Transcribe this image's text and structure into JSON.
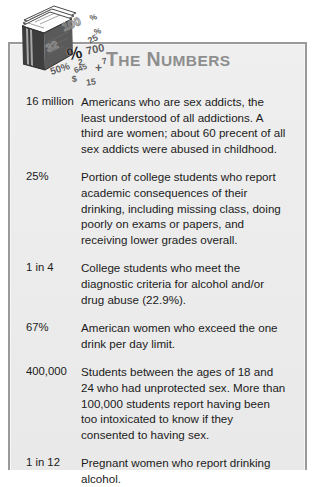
{
  "panel": {
    "title_first_letter": "T",
    "title_rest_word1": "HE",
    "title_second_letter": "N",
    "title_rest_word2": "UMBERS",
    "title_full": "THE NUMBERS",
    "icon_name": "stack-of-papers-icon",
    "background_color": "#ececec",
    "border_color": "#9a9a9a",
    "title_color": "#8e8e8e",
    "text_color": "#1b1b1b"
  },
  "numerals": [
    {
      "text": "100",
      "x": 52,
      "y": 17,
      "size": 11.5,
      "rot": -22,
      "style": "outline"
    },
    {
      "text": "%",
      "x": 80,
      "y": 12,
      "size": 8,
      "rot": -18,
      "style": "solid"
    },
    {
      "text": "%",
      "x": 84,
      "y": 26,
      "size": 8,
      "rot": -15,
      "style": "solid"
    },
    {
      "text": "25",
      "x": 78,
      "y": 33,
      "size": 9,
      "rot": -28,
      "style": "solid"
    },
    {
      "text": "32",
      "x": 36,
      "y": 39,
      "size": 11,
      "rot": -25,
      "style": "outline"
    },
    {
      "text": "%",
      "x": 57,
      "y": 43,
      "size": 17,
      "rot": -12,
      "style": "bold"
    },
    {
      "text": "700",
      "x": 76,
      "y": 42,
      "size": 11,
      "rot": -12,
      "style": "solid"
    },
    {
      "text": "2",
      "x": 68,
      "y": 56,
      "size": 8.5,
      "rot": -8,
      "style": "solid"
    },
    {
      "text": "7",
      "x": 92,
      "y": 55,
      "size": 8.5,
      "rot": -10,
      "style": "solid"
    },
    {
      "text": "50%",
      "x": 40,
      "y": 62,
      "size": 10,
      "rot": -18,
      "style": "solid"
    },
    {
      "text": "645",
      "x": 64,
      "y": 63,
      "size": 8,
      "rot": -22,
      "style": "solid"
    },
    {
      "text": "+",
      "x": 85,
      "y": 60,
      "size": 12,
      "rot": 0,
      "style": "solid"
    },
    {
      "text": "$",
      "x": 62,
      "y": 73,
      "size": 9,
      "rot": -8,
      "style": "solid"
    },
    {
      "text": "15",
      "x": 76,
      "y": 76,
      "size": 9,
      "rot": -8,
      "style": "solid"
    }
  ],
  "rows": [
    {
      "value": "16 million",
      "description": "Americans who are sex addicts, the least understood of all addictions. A third are women; about 60 precent of all sex addicts were abused in childhood."
    },
    {
      "value": "25%",
      "description": "Portion of college students who report academic consequences of their drinking, including missing class, doing poorly on exams or papers, and receiving lower grades overall."
    },
    {
      "value": "1 in 4",
      "description": "College students who meet the diagnostic criteria for alcohol and/or drug abuse (22.9%)."
    },
    {
      "value": "67%",
      "description": "American women who exceed the one drink per day limit."
    },
    {
      "value": "400,000",
      "description": "Students between the ages of 18 and 24 who had unprotected sex. More than 100,000 students report having been too intoxicated to know if they consented to having sex."
    },
    {
      "value": "1 in 12",
      "description": "Pregnant women who report drinking alcohol."
    }
  ]
}
